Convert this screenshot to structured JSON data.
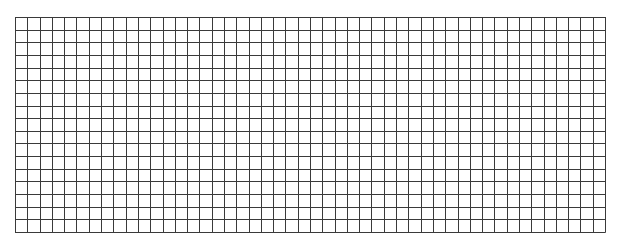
{
  "grid": {
    "columns": 48,
    "rows": 17,
    "left": 15,
    "top": 17,
    "right": 605,
    "bottom": 232,
    "line_color": "#3a3a3a",
    "background": "#ffffff"
  }
}
